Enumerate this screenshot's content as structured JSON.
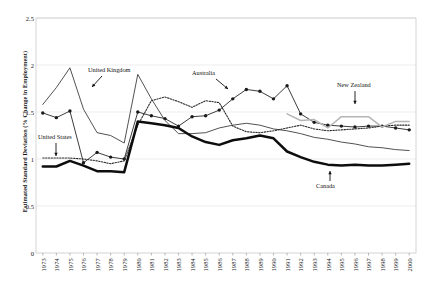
{
  "chart_data": {
    "type": "line",
    "title": "",
    "xlabel": "",
    "ylabel": "Estimated Standard Deviation (% Change in Employment)",
    "ylim": [
      0,
      2.5
    ],
    "yticks": [
      0,
      0.5,
      1,
      1.5,
      2,
      2.5
    ],
    "ytick_labels": [
      "0",
      "0.5",
      "1",
      "1.5",
      "2",
      "2.5"
    ],
    "grid": "horizontal",
    "legend": "annotations",
    "categories": [
      1973,
      1974,
      1975,
      1976,
      1977,
      1978,
      1979,
      1980,
      1981,
      1982,
      1983,
      1984,
      1985,
      1986,
      1987,
      1988,
      1989,
      1990,
      1991,
      1992,
      1993,
      1994,
      1995,
      1996,
      1997,
      1998,
      1999,
      2000
    ],
    "xtick_labels": [
      "1973",
      "1974",
      "1975",
      "1976",
      "1977",
      "1978",
      "1979",
      "1980",
      "1981",
      "1982",
      "1983",
      "1984",
      "1985",
      "1986",
      "1987",
      "1988",
      "1989",
      "1990",
      "1991",
      "1992",
      "1993",
      "1994",
      "1995",
      "1996",
      "1997",
      "1998",
      "1999",
      "2000"
    ],
    "series": [
      {
        "name": "Australia",
        "style": "solid-thin-markers",
        "color": "#1a1a1a",
        "marker": "diamond",
        "values": [
          1.49,
          1.44,
          1.51,
          0.96,
          1.07,
          1.02,
          1.0,
          1.5,
          1.46,
          1.43,
          1.35,
          1.45,
          1.46,
          1.52,
          1.64,
          1.74,
          1.72,
          1.64,
          1.78,
          1.48,
          1.39,
          1.36,
          1.35,
          1.34,
          1.35,
          1.35,
          1.33,
          1.31
        ]
      },
      {
        "name": "United Kingdom",
        "style": "solid-thin",
        "color": "#333333",
        "marker": "none",
        "values": [
          1.58,
          1.76,
          1.97,
          1.53,
          1.28,
          1.25,
          1.17,
          1.9,
          1.64,
          1.41,
          1.27,
          1.27,
          1.28,
          1.33,
          1.36,
          1.38,
          1.36,
          1.32,
          1.3,
          1.27,
          1.23,
          1.21,
          1.18,
          1.16,
          1.13,
          1.12,
          1.1,
          1.09
        ]
      },
      {
        "name": "United States",
        "style": "dotted",
        "color": "#2b2b2b",
        "marker": "none",
        "values": [
          1.01,
          1.01,
          1.01,
          1.0,
          0.98,
          0.95,
          0.98,
          1.36,
          1.62,
          1.66,
          1.61,
          1.55,
          1.62,
          1.6,
          1.35,
          1.29,
          1.28,
          1.3,
          1.33,
          1.36,
          1.32,
          1.3,
          1.31,
          1.32,
          1.33,
          1.35,
          1.36,
          1.36
        ]
      },
      {
        "name": "Canada",
        "style": "solid-thick",
        "color": "#0d0d0d",
        "marker": "none",
        "values": [
          0.92,
          0.92,
          0.98,
          0.93,
          0.87,
          0.87,
          0.86,
          1.4,
          1.38,
          1.36,
          1.33,
          1.24,
          1.18,
          1.15,
          1.2,
          1.22,
          1.25,
          1.22,
          1.08,
          1.02,
          0.97,
          0.94,
          0.93,
          0.94,
          0.93,
          0.93,
          0.94,
          0.95
        ]
      },
      {
        "name": "New Zealand",
        "style": "solid-gray",
        "color": "#b5b5b5",
        "marker": "none",
        "values": [
          null,
          null,
          null,
          null,
          null,
          null,
          null,
          null,
          null,
          null,
          null,
          null,
          null,
          null,
          null,
          null,
          null,
          null,
          1.48,
          1.41,
          1.42,
          1.33,
          1.45,
          1.45,
          1.45,
          1.34,
          1.4,
          1.4
        ]
      }
    ],
    "annotations": [
      {
        "label": "United Kingdom",
        "x": 88,
        "y": 66,
        "arrow": "down-left"
      },
      {
        "label": "United States",
        "x": 38,
        "y": 133,
        "arrow": "down"
      },
      {
        "label": "Australia",
        "x": 192,
        "y": 69,
        "arrow": "down-right"
      },
      {
        "label": "New Zealand",
        "x": 337,
        "y": 81,
        "arrow": "down"
      },
      {
        "label": "Canada",
        "x": 316,
        "y": 182,
        "arrow": "up"
      }
    ]
  }
}
